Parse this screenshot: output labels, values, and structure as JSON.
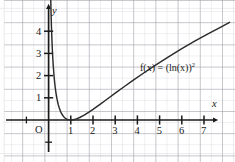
{
  "chart_data": {
    "type": "line",
    "title": "",
    "subtitle": "",
    "xlabel": "x",
    "ylabel": "y",
    "origin_label": "O",
    "function_expression": "f(x) = (ln(x))",
    "function_exponent": "2",
    "annotations": [
      {
        "text": "f(x) = (ln(x))2",
        "x_data": 4.1,
        "y_data": 1.95
      }
    ],
    "legend": [],
    "legend_position": "none",
    "grid": true,
    "grid_major_color": "#8e8e96",
    "grid_minor_color": "#cfcfd6",
    "curve_color": "#2b2b2b",
    "axis_color": "#1a1a1a",
    "background_color": "#ffffff",
    "xlim": [
      -0.85,
      8.15
    ],
    "ylim": [
      -0.75,
      4.85
    ],
    "x_ticks": [
      1,
      2,
      3,
      4,
      5,
      6,
      7
    ],
    "y_ticks": [
      1,
      2,
      3,
      4
    ],
    "x_tick_labels": [
      "1",
      "2",
      "3",
      "4",
      "5",
      "6",
      "7"
    ],
    "y_tick_labels": [
      "1",
      "2",
      "3",
      "4"
    ],
    "minor_subdivisions": 2,
    "series": [
      {
        "name": "f(x) = (ln(x))^2",
        "x": [
          0.095,
          0.11,
          0.13,
          0.15,
          0.17,
          0.19,
          0.21,
          0.24,
          0.27,
          0.3,
          0.34,
          0.38,
          0.43,
          0.48,
          0.54,
          0.6,
          0.67,
          0.74,
          0.82,
          0.9,
          1.0,
          1.12,
          1.25,
          1.4,
          1.6,
          1.8,
          2.0,
          2.3,
          2.6,
          3.0,
          3.4,
          3.8,
          4.3,
          4.8,
          5.4,
          6.0,
          6.6,
          7.2,
          7.8,
          8.15
        ],
        "y": [
          5.54,
          4.85,
          4.16,
          3.6,
          3.14,
          2.76,
          2.44,
          2.04,
          1.71,
          1.45,
          1.16,
          0.94,
          0.71,
          0.54,
          0.38,
          0.26,
          0.16,
          0.09,
          0.039,
          0.011,
          0.0,
          0.013,
          0.05,
          0.113,
          0.221,
          0.345,
          0.48,
          0.694,
          0.913,
          1.207,
          1.497,
          1.783,
          2.128,
          2.461,
          2.841,
          3.211,
          3.561,
          3.895,
          4.208,
          4.398
        ]
      }
    ]
  }
}
